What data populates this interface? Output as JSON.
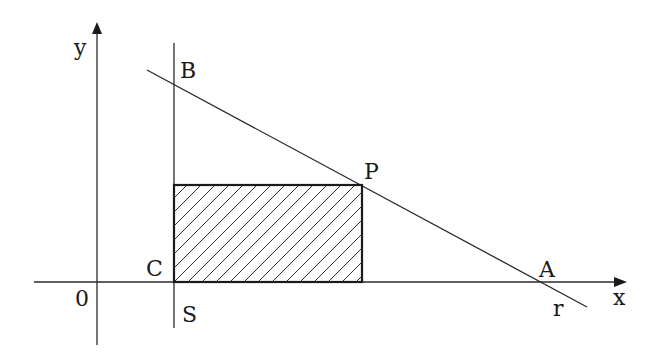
{
  "diagram": {
    "type": "geometry",
    "labels": {
      "y_axis": "y",
      "x_axis": "x",
      "origin": "0",
      "B": "B",
      "P": "P",
      "C": "C",
      "A": "A",
      "S": "S",
      "r": "r"
    },
    "points": {
      "origin": [
        97,
        282
      ],
      "B": [
        174,
        84
      ],
      "P": [
        362,
        185
      ],
      "C": [
        174,
        282
      ],
      "A": [
        540,
        282
      ]
    },
    "lines": {
      "x_axis": {
        "from": [
          34,
          282
        ],
        "to": [
          626,
          282
        ]
      },
      "y_axis": {
        "from": [
          97,
          345
        ],
        "to": [
          97,
          22
        ]
      },
      "S": {
        "from": [
          174,
          43
        ],
        "to": [
          174,
          328
        ]
      },
      "r": {
        "from": [
          147,
          70
        ],
        "to": [
          587,
          307
        ]
      }
    },
    "shaded_rectangle": {
      "x": 174,
      "y": 185,
      "width": 188,
      "height": 97,
      "hatch": "diagonal"
    },
    "colors": {
      "stroke": "#1a1a1a",
      "background": "#ffffff"
    }
  }
}
